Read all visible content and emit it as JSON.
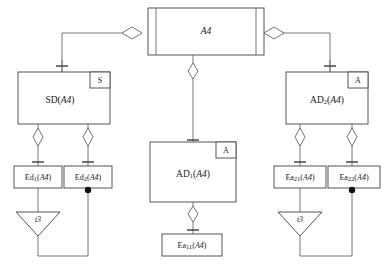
{
  "diagram": {
    "type": "hierarchical-block-diagram",
    "colors": {
      "stroke": "#666666",
      "box_stroke": "#555555",
      "text": "#1a1a1a",
      "background": "#ffffff",
      "dot": "#111111"
    },
    "nodes": {
      "root": {
        "label": "A4",
        "style": "double-bar-box",
        "badge": ""
      },
      "sd": {
        "label_prefix": "SD(",
        "label_arg": "A4",
        "label_suffix": ")",
        "label_full": "SD(A4)",
        "badge": "S"
      },
      "ad1": {
        "label_prefix": "AD",
        "label_sub": "1",
        "label_arg": "A4",
        "label_full": "AD1(A4)",
        "badge": "A"
      },
      "ad2": {
        "label_prefix": "AD",
        "label_sub": "2",
        "label_arg": "A4",
        "label_full": "AD2(A4)",
        "badge": "A"
      },
      "ed1": {
        "label_prefix": "Ed",
        "label_sub": "1",
        "label_arg": "A4",
        "label_full": "Ed1(A4)"
      },
      "ed2": {
        "label_prefix": "Ed",
        "label_sub": "2",
        "label_arg": "A4",
        "label_full": "Ed2(A4)"
      },
      "ea11": {
        "label_prefix": "Ea",
        "label_sub": "11",
        "label_arg": "A4",
        "label_full": "Ea11(A4)"
      },
      "ea21": {
        "label_prefix": "Ea",
        "label_sub": "21",
        "label_arg": "A4",
        "label_full": "Ea21(A4)"
      },
      "ea22": {
        "label_prefix": "Ea",
        "label_sub": "22",
        "label_arg": "A4",
        "label_full": "Ea22(A4)"
      },
      "tri_left": {
        "label": "t3",
        "shape": "down-triangle"
      },
      "tri_right": {
        "label": "t3",
        "shape": "down-triangle"
      }
    },
    "connectors": {
      "aggregation_diamond": "open-diamond",
      "terminator": "tick-bar",
      "junction": "filled-dot"
    }
  }
}
